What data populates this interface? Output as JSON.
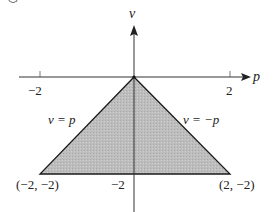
{
  "figure": {
    "axes": {
      "x_label": "p",
      "y_label": "v",
      "x_ticks": [
        {
          "value": -2,
          "label": "−2"
        },
        {
          "value": 2,
          "label": "2"
        }
      ],
      "y_ticks": [
        {
          "value": -2,
          "label": "−2"
        }
      ]
    },
    "region": {
      "description": "shaded triangle",
      "fill_color": "#b9b9b9",
      "edge_color": "#1a1a1a",
      "vertices": [
        [
          0,
          0
        ],
        [
          -2,
          -2
        ],
        [
          2,
          -2
        ]
      ]
    },
    "lines": [
      {
        "label": "v = p",
        "equation": "v = p"
      },
      {
        "label": "v = −p",
        "equation": "v = -p"
      }
    ],
    "vertex_labels": [
      {
        "point": [
          -2,
          -2
        ],
        "label": "(−2, −2)"
      },
      {
        "point": [
          2,
          -2
        ],
        "label": "(2, −2)"
      }
    ]
  }
}
